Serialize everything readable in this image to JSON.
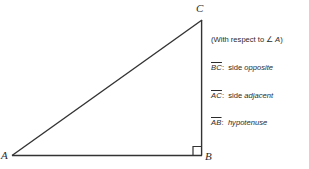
{
  "figure": {
    "type": "right-triangle-diagram",
    "background_color": "#ffffff",
    "stroke_color": "#333333",
    "text_color": "#2b2b2b"
  },
  "triangle": {
    "vertices": [
      {
        "name": "A",
        "label": "A",
        "x": 12,
        "y": 156
      },
      {
        "name": "B",
        "label": "B",
        "x": 202,
        "y": 156
      },
      {
        "name": "C",
        "label": "C",
        "x": 202,
        "y": 20
      }
    ],
    "right_angle_at": "B",
    "right_angle_marker": {
      "x": 193,
      "y": 147,
      "size": 9
    }
  },
  "legend": {
    "note": "(With respect to ",
    "note_angle_symbol": "∠",
    "note_angle_vertex": " A",
    "note_close": ")",
    "rows": [
      {
        "segment": "BC",
        "colon": ":",
        "prefix": "side ",
        "term": "opposite"
      },
      {
        "segment": "AC",
        "colon": ":",
        "prefix": "side ",
        "term": "adjacent"
      },
      {
        "segment": "AB",
        "colon": ":",
        "prefix": "",
        "term": "hypotenuse"
      }
    ]
  }
}
